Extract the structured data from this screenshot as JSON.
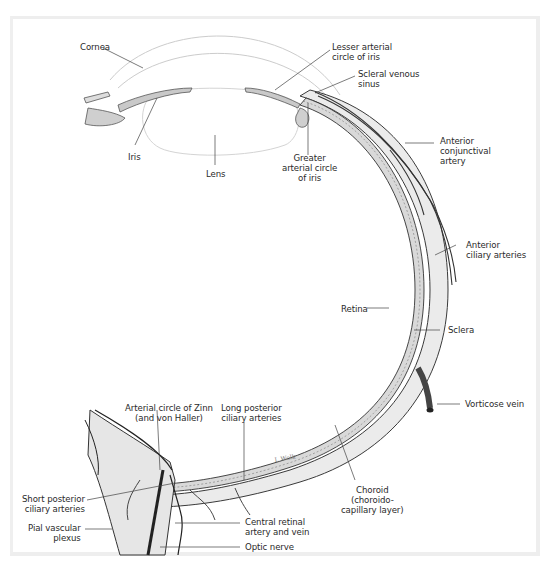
{
  "figure": {
    "colors": {
      "line": "#2b2b2b",
      "vessel": "#3a3a3a",
      "sclera_fill": "#e9e9e9",
      "choroid_fill": "#d8d8d8",
      "cornea_line": "#c8c8c8",
      "frame": "#eeeeee",
      "background": "#ffffff"
    },
    "labels": {
      "cornea": "Cornea",
      "lesser_arterial_circle": "Lesser arterial\ncircle of iris",
      "scleral_venous_sinus": "Scleral venous\nsinus",
      "anterior_conjunctival_artery": "Anterior\nconjunctival\nartery",
      "iris": "Iris",
      "lens": "Lens",
      "greater_arterial_circle": "Greater\narterial circle\nof iris",
      "anterior_ciliary_arteries": "Anterior\nciliary arteries",
      "retina": "Retina",
      "sclera": "Sclera",
      "vorticose_vein": "Vorticose vein",
      "arterial_circle_zinn": "Arterial circle of Zinn\n(and von Haller)",
      "long_posterior_ciliary": "Long posterior\nciliary arteries",
      "choroid": "Choroid\n(choroido-\ncapillary layer)",
      "short_posterior_ciliary": "Short posterior\nciliary arteries",
      "pial_vascular_plexus": "Pial vascular\nplexus",
      "central_retinal": "Central retinal\nartery and vein",
      "optic_nerve": "Optic nerve"
    },
    "signature": "I. Wolk"
  }
}
